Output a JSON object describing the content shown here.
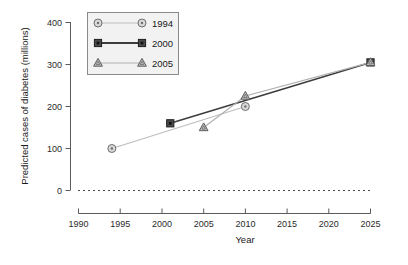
{
  "chart_data": {
    "type": "line",
    "title": "",
    "xlabel": "Year",
    "ylabel": "Predicted cases of diabetes (millions)",
    "xlim": [
      1990,
      2025
    ],
    "ylim": [
      0,
      400
    ],
    "xticks": [
      "1990",
      "1995",
      "2000",
      "2005",
      "2010",
      "2015",
      "2020",
      "2025"
    ],
    "yticks": [
      "0",
      "100",
      "200",
      "300",
      "400"
    ],
    "grid": false,
    "legend_position": "top-left",
    "reference_line": {
      "y": 0,
      "style": "dotted"
    },
    "series": [
      {
        "name": "1994",
        "marker": "circle-dot",
        "color": "#bdbdbd",
        "marker_fill": "#d9d9d9",
        "marker_stroke": "#6e6e6e",
        "points": [
          {
            "x": 1994,
            "y": 100
          },
          {
            "x": 2010,
            "y": 200
          }
        ]
      },
      {
        "name": "2000",
        "marker": "square-filled",
        "color": "#3d3d3d",
        "marker_fill": "#4a4a4a",
        "marker_stroke": "#1f1f1f",
        "points": [
          {
            "x": 2001,
            "y": 160
          },
          {
            "x": 2025,
            "y": 305
          }
        ]
      },
      {
        "name": "2005",
        "marker": "triangle",
        "color": "#b0b0b0",
        "marker_fill": "#c4c4c4",
        "marker_stroke": "#5c5c5c",
        "points": [
          {
            "x": 2005,
            "y": 150
          },
          {
            "x": 2010,
            "y": 225
          },
          {
            "x": 2025,
            "y": 305
          }
        ]
      }
    ]
  },
  "axes": {
    "y_title": "Predicted cases of diabetes (millions)",
    "x_title": "Year",
    "y_tick_labels": [
      "400",
      "300",
      "200",
      "100",
      "0"
    ],
    "x_tick_labels": [
      "1990",
      "1995",
      "2000",
      "2005",
      "2010",
      "2015",
      "2020",
      "2025"
    ]
  },
  "legend": {
    "entries": [
      {
        "label": "1994"
      },
      {
        "label": "2000"
      },
      {
        "label": "2005"
      }
    ]
  }
}
